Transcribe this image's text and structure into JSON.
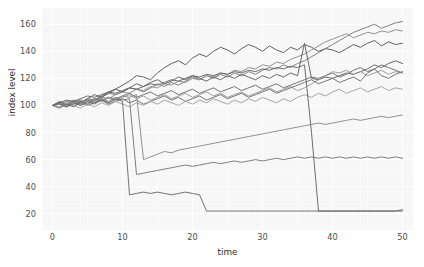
{
  "chart_data": {
    "type": "line",
    "title": "",
    "xlabel": "time",
    "ylabel": "index level",
    "xlim": [
      -1.5,
      51.5
    ],
    "ylim": [
      8,
      172
    ],
    "xticks": [
      0,
      10,
      20,
      30,
      40,
      50
    ],
    "yticks": [
      20,
      40,
      60,
      80,
      100,
      120,
      140,
      160
    ],
    "grid": true,
    "grid_color": "#ffffff",
    "panel_color": "#f7f7f7",
    "legend": "none",
    "x": [
      0,
      1,
      2,
      3,
      4,
      5,
      6,
      7,
      8,
      9,
      10,
      11,
      12,
      13,
      14,
      15,
      16,
      17,
      18,
      19,
      20,
      21,
      22,
      23,
      24,
      25,
      26,
      27,
      28,
      29,
      30,
      31,
      32,
      33,
      34,
      35,
      36,
      37,
      38,
      39,
      40,
      41,
      42,
      43,
      44,
      45,
      46,
      47,
      48,
      49,
      50
    ],
    "series": [
      {
        "name": "index-1",
        "color": "#575757",
        "values": [
          100,
          101,
          99,
          103,
          102,
          105,
          104,
          107,
          110,
          112,
          115,
          118,
          122,
          121,
          119,
          124,
          128,
          131,
          133,
          130,
          135,
          138,
          136,
          140,
          143,
          141,
          138,
          142,
          145,
          143,
          140,
          144,
          141,
          139,
          143,
          141,
          145,
          143,
          140,
          142,
          141,
          139,
          142,
          145,
          143,
          146,
          148,
          144,
          147,
          145,
          146
        ]
      },
      {
        "name": "index-2",
        "color": "#7a7a7a",
        "values": [
          100,
          102,
          101,
          104,
          103,
          101,
          104,
          106,
          109,
          108,
          110,
          113,
          112,
          110,
          113,
          116,
          114,
          117,
          115,
          118,
          121,
          119,
          122,
          120,
          123,
          121,
          124,
          122,
          125,
          123,
          126,
          128,
          127,
          130,
          128,
          131,
          133,
          136,
          139,
          142,
          145,
          148,
          151,
          154,
          156,
          158,
          160,
          157,
          159,
          161,
          162
        ]
      },
      {
        "name": "index-3",
        "color": "#8c8c8c",
        "values": [
          100,
          99,
          101,
          100,
          102,
          104,
          103,
          106,
          105,
          108,
          110,
          109,
          112,
          111,
          114,
          113,
          116,
          115,
          118,
          117,
          120,
          119,
          122,
          121,
          124,
          123,
          126,
          125,
          128,
          127,
          130,
          129,
          132,
          131,
          134,
          136,
          138,
          141,
          144,
          147,
          149,
          151,
          153,
          150,
          152,
          154,
          153,
          155,
          154,
          156,
          155
        ]
      },
      {
        "name": "index-4",
        "color": "#606060",
        "values": [
          100,
          103,
          101,
          99,
          102,
          105,
          108,
          106,
          109,
          112,
          110,
          113,
          116,
          114,
          117,
          119,
          116,
          118,
          121,
          119,
          122,
          120,
          118,
          121,
          119,
          122,
          120,
          123,
          121,
          119,
          122,
          120,
          123,
          121,
          124,
          122,
          146,
          120,
          119,
          121,
          120,
          122,
          124,
          123,
          125,
          127,
          130,
          128,
          131,
          133,
          131
        ]
      },
      {
        "name": "index-5",
        "color": "#6e6e6e",
        "values": [
          100,
          98,
          101,
          103,
          100,
          102,
          105,
          103,
          106,
          104,
          107,
          109,
          106,
          108,
          110,
          107,
          109,
          111,
          108,
          110,
          112,
          109,
          111,
          113,
          110,
          112,
          114,
          111,
          113,
          115,
          112,
          114,
          116,
          113,
          115,
          117,
          119,
          121,
          120,
          122,
          124,
          121,
          123,
          126,
          128,
          125,
          127,
          130,
          128,
          126,
          124
        ]
      },
      {
        "name": "index-6",
        "color": "#999999",
        "values": [
          100,
          101,
          103,
          102,
          104,
          101,
          103,
          105,
          102,
          104,
          106,
          108,
          105,
          107,
          104,
          106,
          108,
          105,
          107,
          109,
          106,
          108,
          110,
          107,
          109,
          106,
          108,
          110,
          107,
          109,
          111,
          113,
          110,
          112,
          114,
          111,
          113,
          116,
          119,
          122,
          125,
          124,
          126,
          123,
          125,
          122,
          124,
          126,
          123,
          125,
          124
        ]
      },
      {
        "name": "index-7",
        "color": "#707070",
        "values": [
          100,
          102,
          99,
          101,
          103,
          100,
          102,
          104,
          101,
          103,
          105,
          102,
          104,
          101,
          103,
          105,
          107,
          104,
          106,
          103,
          105,
          107,
          104,
          106,
          108,
          105,
          107,
          109,
          106,
          108,
          110,
          112,
          109,
          111,
          113,
          115,
          117,
          119,
          116,
          118,
          120,
          117,
          119,
          121,
          118,
          124,
          127,
          122,
          120,
          123,
          125
        ]
      },
      {
        "name": "index-8",
        "color": "#a0a0a0",
        "values": [
          100,
          99,
          102,
          100,
          98,
          101,
          99,
          102,
          100,
          103,
          101,
          99,
          102,
          100,
          103,
          101,
          104,
          102,
          100,
          103,
          101,
          104,
          102,
          105,
          103,
          101,
          104,
          102,
          105,
          103,
          106,
          104,
          102,
          105,
          103,
          106,
          108,
          106,
          109,
          107,
          110,
          112,
          109,
          111,
          113,
          110,
          112,
          114,
          111,
          113,
          112
        ]
      },
      {
        "name": "index-9-crash-t10",
        "color": "#6b6b6b",
        "values": [
          100,
          101,
          99,
          102,
          100,
          103,
          101,
          104,
          102,
          105,
          103,
          34,
          35,
          36,
          35,
          36,
          35,
          34,
          35,
          36,
          35,
          34,
          22,
          22,
          22,
          22,
          22,
          22,
          22,
          22,
          22,
          22,
          22,
          22,
          22,
          22,
          22,
          22,
          22,
          22,
          22,
          22,
          22,
          22,
          22,
          22,
          22,
          22,
          22,
          22,
          22
        ]
      },
      {
        "name": "index-10-crash-t12",
        "color": "#787878",
        "values": [
          100,
          102,
          100,
          103,
          101,
          104,
          102,
          105,
          103,
          106,
          104,
          105,
          49,
          50,
          51,
          52,
          53,
          54,
          55,
          56,
          55,
          56,
          57,
          58,
          57,
          58,
          59,
          58,
          59,
          60,
          59,
          60,
          61,
          60,
          61,
          62,
          61,
          62,
          61,
          62,
          61,
          62,
          61,
          62,
          61,
          62,
          61,
          62,
          61,
          62,
          61
        ]
      },
      {
        "name": "index-11-crash-t13",
        "color": "#8a8a8a",
        "values": [
          100,
          101,
          103,
          102,
          104,
          103,
          105,
          104,
          106,
          105,
          107,
          106,
          108,
          60,
          62,
          64,
          66,
          65,
          67,
          68,
          69,
          70,
          71,
          72,
          73,
          74,
          75,
          76,
          77,
          78,
          79,
          80,
          81,
          82,
          83,
          84,
          85,
          86,
          87,
          86,
          87,
          88,
          89,
          90,
          89,
          90,
          91,
          92,
          91,
          92,
          93
        ]
      },
      {
        "name": "index-12-crash-t37",
        "color": "#656565",
        "values": [
          100,
          102,
          104,
          103,
          105,
          107,
          106,
          108,
          110,
          109,
          111,
          113,
          112,
          114,
          116,
          115,
          117,
          119,
          118,
          120,
          122,
          121,
          123,
          122,
          124,
          123,
          125,
          124,
          126,
          125,
          127,
          126,
          128,
          127,
          129,
          128,
          130,
          80,
          22,
          22,
          22,
          22,
          22,
          22,
          22,
          22,
          22,
          22,
          22,
          22,
          23
        ]
      }
    ]
  }
}
